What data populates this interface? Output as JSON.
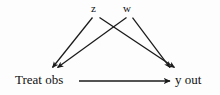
{
  "diagram": {
    "type": "directed-acyclic-graph",
    "background_color": "#fdfdfd",
    "stroke_color": "#1a1a1a",
    "text_color": "#111111",
    "nodes": [
      {
        "id": "z",
        "label": "z",
        "x": 95,
        "y": 10
      },
      {
        "id": "w",
        "label": "w",
        "x": 128,
        "y": 10
      },
      {
        "id": "treat",
        "label": "Treat obs",
        "x": 45,
        "y": 81
      },
      {
        "id": "yout",
        "label": "y out",
        "x": 191,
        "y": 81
      }
    ],
    "edges": [
      {
        "from": "z",
        "to": "treat",
        "arrow": true
      },
      {
        "from": "z",
        "to": "yout",
        "arrow": true
      },
      {
        "from": "w",
        "to": "treat",
        "arrow": true
      },
      {
        "from": "w",
        "to": "yout",
        "arrow": true
      },
      {
        "from": "treat",
        "to": "yout",
        "arrow": true
      }
    ]
  }
}
